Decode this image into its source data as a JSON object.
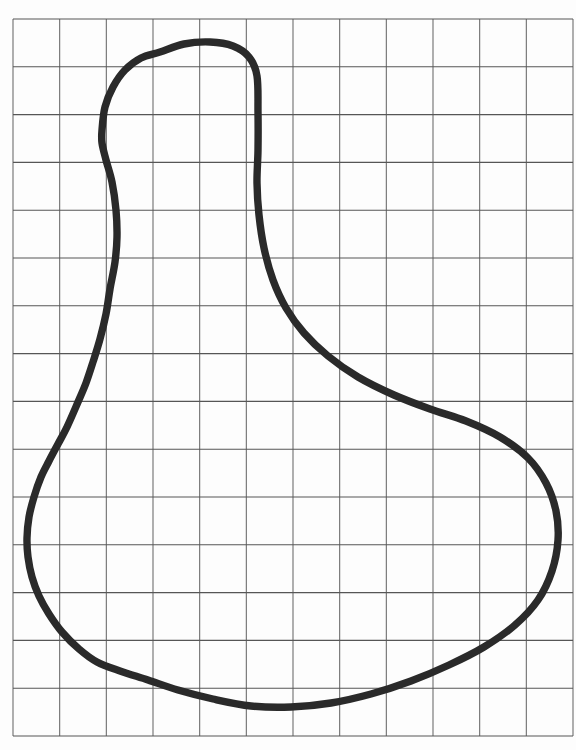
{
  "figure": {
    "width": 576,
    "height": 750,
    "background": "#fdfdfd",
    "grid": {
      "x0": 13,
      "y0": 19,
      "x1": 573,
      "y1": 736,
      "cols": 12,
      "rows": 15,
      "vertical_line_color": "#6e6e6e",
      "horizontal_line_color": "#565656",
      "line_width": 1.1
    },
    "curve": {
      "type": "closed-smooth",
      "stroke_color": "#2a2a2a",
      "stroke_width": 7.4,
      "fill": "none",
      "points": [
        [
          160,
          52
        ],
        [
          184,
          44
        ],
        [
          210,
          42
        ],
        [
          233,
          46
        ],
        [
          249,
          57
        ],
        [
          257,
          76
        ],
        [
          258,
          112
        ],
        [
          258,
          150
        ],
        [
          257,
          183
        ],
        [
          259,
          215
        ],
        [
          264,
          248
        ],
        [
          273,
          280
        ],
        [
          286,
          308
        ],
        [
          304,
          333
        ],
        [
          328,
          356
        ],
        [
          358,
          377
        ],
        [
          394,
          395
        ],
        [
          430,
          409
        ],
        [
          466,
          421
        ],
        [
          500,
          437
        ],
        [
          528,
          458
        ],
        [
          546,
          483
        ],
        [
          556,
          511
        ],
        [
          558,
          540
        ],
        [
          552,
          571
        ],
        [
          538,
          600
        ],
        [
          515,
          625
        ],
        [
          484,
          647
        ],
        [
          449,
          665
        ],
        [
          411,
          681
        ],
        [
          371,
          694
        ],
        [
          331,
          703
        ],
        [
          291,
          707
        ],
        [
          251,
          706
        ],
        [
          213,
          699
        ],
        [
          178,
          690
        ],
        [
          148,
          680
        ],
        [
          120,
          671
        ],
        [
          97,
          662
        ],
        [
          79,
          649
        ],
        [
          62,
          632
        ],
        [
          49,
          614
        ],
        [
          39,
          596
        ],
        [
          32,
          577
        ],
        [
          28,
          557
        ],
        [
          27,
          538
        ],
        [
          29,
          517
        ],
        [
          34,
          497
        ],
        [
          41,
          477
        ],
        [
          49,
          461
        ],
        [
          58,
          444
        ],
        [
          67,
          427
        ],
        [
          78,
          402
        ],
        [
          86,
          383
        ],
        [
          93,
          362
        ],
        [
          100,
          339
        ],
        [
          106,
          314
        ],
        [
          110,
          289
        ],
        [
          115,
          262
        ],
        [
          117,
          237
        ],
        [
          116,
          210
        ],
        [
          112,
          182
        ],
        [
          106,
          160
        ],
        [
          102,
          143
        ],
        [
          102,
          130
        ],
        [
          105,
          107
        ],
        [
          113,
          87
        ],
        [
          125,
          70
        ],
        [
          141,
          58
        ]
      ]
    }
  }
}
